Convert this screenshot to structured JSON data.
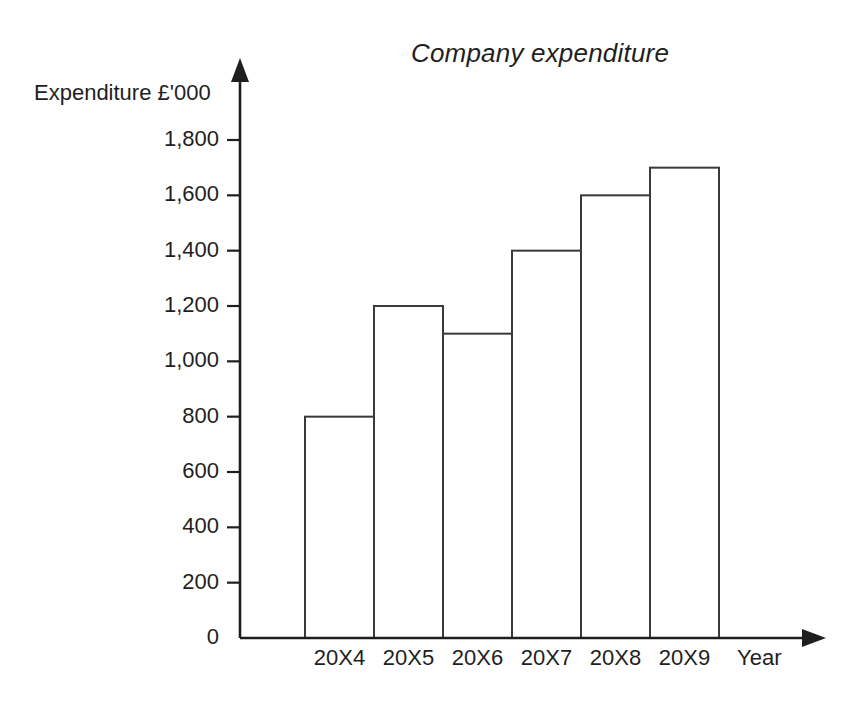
{
  "chart_data": {
    "type": "bar",
    "title": "Company expenditure",
    "xlabel": "Year",
    "ylabel": "Expenditure £'000",
    "categories": [
      "20X4",
      "20X5",
      "20X6",
      "20X7",
      "20X8",
      "20X9"
    ],
    "values": [
      800,
      1200,
      1100,
      1400,
      1600,
      1700
    ],
    "ylim": [
      0,
      1800
    ],
    "ytick_labels": [
      "1,800",
      "1,600",
      "1,400",
      "1,200",
      "1,000",
      "800",
      "600",
      "400",
      "200",
      "0"
    ],
    "ytick_values": [
      1800,
      1600,
      1400,
      1200,
      1000,
      800,
      600,
      400,
      200,
      0
    ],
    "grid": false,
    "legend": false,
    "bar_fill_color": "#ffffff",
    "bar_stroke_color": "#3a3a3a",
    "axis_color": "#1f1f1f",
    "background_color": "#ffffff"
  }
}
